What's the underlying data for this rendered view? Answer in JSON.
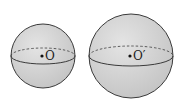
{
  "figure": {
    "spheres": [
      {
        "name": "sphere-o",
        "center_label": "O",
        "cx": 43,
        "cy": 56,
        "r": 32
      },
      {
        "name": "sphere-o-prime",
        "center_label": "O′",
        "cx": 131,
        "cy": 56,
        "r": 42
      }
    ],
    "colors": {
      "fill": "#d4d4d4",
      "stroke": "#3a3a3a",
      "background": "#ffffff"
    }
  }
}
